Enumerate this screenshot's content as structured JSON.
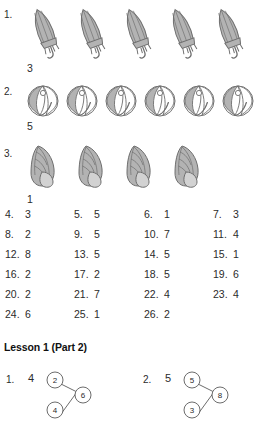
{
  "page": {
    "background": "#ffffff",
    "ink": "#2b2b2b",
    "object_fill": "#b3b3b3",
    "object_stroke": "#6e6e6e",
    "cross_color": "#8a8a8a"
  },
  "pictorial_problems": [
    {
      "number": "1.",
      "icon": "umbrella-icon",
      "total": 5,
      "crossed_out": 2,
      "answer": "3"
    },
    {
      "number": "2.",
      "icon": "beach-ball-icon",
      "total": 6,
      "crossed_out": 1,
      "answer": "5"
    },
    {
      "number": "3.",
      "icon": "seashell-icon",
      "total": 4,
      "crossed_out": 3,
      "answer": "1"
    }
  ],
  "answer_grid": {
    "rows": [
      [
        {
          "label": "4.",
          "value": "3"
        },
        {
          "label": "5.",
          "value": "5"
        },
        {
          "label": "6.",
          "value": "1"
        },
        {
          "label": "7.",
          "value": "3"
        }
      ],
      [
        {
          "label": "8.",
          "value": "2"
        },
        {
          "label": "9.",
          "value": "5"
        },
        {
          "label": "10.",
          "value": "7"
        },
        {
          "label": "11.",
          "value": "4"
        }
      ],
      [
        {
          "label": "12.",
          "value": "8"
        },
        {
          "label": "13.",
          "value": "5"
        },
        {
          "label": "14.",
          "value": "5"
        },
        {
          "label": "15.",
          "value": "1"
        }
      ],
      [
        {
          "label": "16.",
          "value": "2"
        },
        {
          "label": "17.",
          "value": "2"
        },
        {
          "label": "18.",
          "value": "5"
        },
        {
          "label": "19.",
          "value": "6"
        }
      ],
      [
        {
          "label": "20.",
          "value": "2"
        },
        {
          "label": "21.",
          "value": "7"
        },
        {
          "label": "22.",
          "value": "4"
        },
        {
          "label": "23.",
          "value": "4"
        }
      ],
      [
        {
          "label": "24.",
          "value": "6"
        },
        {
          "label": "25.",
          "value": "1"
        },
        {
          "label": "26.",
          "value": "2"
        }
      ]
    ]
  },
  "lesson_heading": "Lesson 1 (Part 2)",
  "number_bonds": [
    {
      "number": "1.",
      "answer": "4",
      "top": "2",
      "bottom": "4",
      "whole": "6"
    },
    {
      "number": "2.",
      "answer": "5",
      "top": "5",
      "bottom": "3",
      "whole": "8"
    }
  ]
}
